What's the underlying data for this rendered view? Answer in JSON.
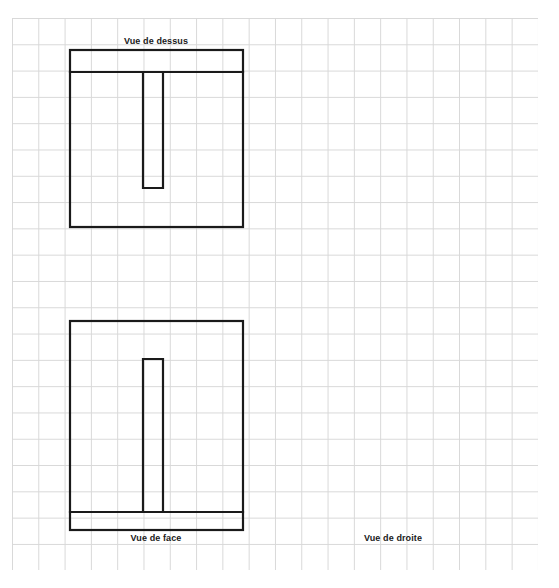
{
  "document": {
    "type": "orthographic-projection-exercise",
    "language": "fr",
    "background_color": "#ffffff",
    "grid": {
      "visible": true,
      "line_color": "#d8d8d8",
      "cell_size_px": 26.3,
      "origin_x": 12,
      "origin_y": 18,
      "width": 526,
      "height": 552
    },
    "line_color": "#1a1a1a",
    "line_width": 2.2
  },
  "labels": {
    "top_view": "Vue de dessus",
    "front_view": "Vue de face",
    "right_view": "Vue de droite"
  },
  "views": {
    "top": {
      "name": "Vue de dessus",
      "label_x": 156,
      "label_y": 36,
      "outline": {
        "x": 70,
        "y": 50,
        "width": 173,
        "height": 177
      },
      "divider_line": {
        "x1": 70,
        "y1": 72,
        "x2": 243,
        "y2": 72
      },
      "slot": {
        "x": 143,
        "y": 72,
        "width": 20,
        "height": 116
      }
    },
    "front": {
      "name": "Vue de face",
      "label_x": 156,
      "label_y": 533,
      "outline": {
        "x": 70,
        "y": 321,
        "width": 173,
        "height": 209
      },
      "base_line": {
        "x1": 70,
        "y1": 512,
        "x2": 243,
        "y2": 512
      },
      "rib": {
        "x": 143,
        "y": 359,
        "width": 20,
        "height": 153
      }
    },
    "right": {
      "name": "Vue de droite",
      "label_x": 393,
      "label_y": 533,
      "drawing_present": false
    }
  }
}
